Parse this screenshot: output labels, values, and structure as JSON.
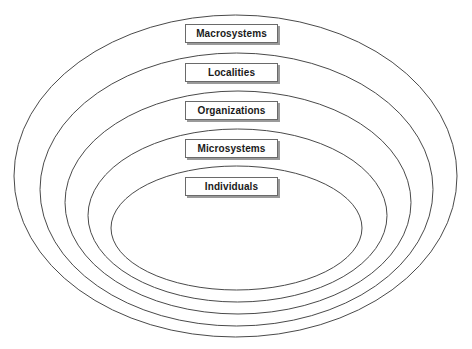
{
  "diagram": {
    "type": "nested-ellipses",
    "layers": [
      {
        "label": "Macrosystems",
        "ellipse": {
          "cx": 235.5,
          "cy": 176,
          "rx": 221.5,
          "ry": 161
        }
      },
      {
        "label": "Localities",
        "ellipse": {
          "cx": 236.5,
          "cy": 189.5,
          "rx": 196.5,
          "ry": 136.5
        }
      },
      {
        "label": "Organizations",
        "ellipse": {
          "cx": 238,
          "cy": 202.5,
          "rx": 173,
          "ry": 111.5
        }
      },
      {
        "label": "Microsystems",
        "ellipse": {
          "cx": 237.5,
          "cy": 215.5,
          "rx": 149.5,
          "ry": 86.5
        }
      },
      {
        "label": "Individuals",
        "ellipse": {
          "cx": 236.5,
          "cy": 228,
          "rx": 125.5,
          "ry": 62
        }
      }
    ],
    "colors": {
      "stroke": "#4a4a4a",
      "box_border": "#6a6a6a",
      "box_shadow": "#9a9a9a",
      "text": "#1a1a1a",
      "background": "#ffffff"
    }
  }
}
